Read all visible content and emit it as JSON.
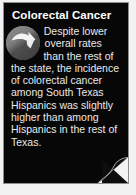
{
  "card": {
    "title": "Colorectal Cancer",
    "body": "Despite lower overall rates than the rest of the state, the incidence of colorectal cancer among South Texas Hispanics was slightly higher than among Hispanics in the rest of Texas.",
    "icon_name": "down-arrow-circle-icon",
    "colors": {
      "card_background": "#070707",
      "page_background": "#f2f2f2",
      "title_text": "#ffffff",
      "body_text": "#e9e9e9",
      "icon_circle_light": "#8d8d8d",
      "icon_circle_dark": "#3a3a3a",
      "icon_arrow": "#f4f4f4",
      "card_border": "#8e8e8e"
    }
  }
}
